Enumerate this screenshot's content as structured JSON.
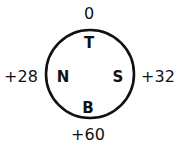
{
  "diagram": {
    "shape": "circle",
    "stroke_color": "#111111",
    "background": "#ffffff",
    "directions": {
      "top": "T",
      "left": "N",
      "right": "S",
      "bottom": "B"
    },
    "values": {
      "top": "0",
      "left": "+28",
      "right": "+32",
      "bottom": "+60"
    }
  }
}
